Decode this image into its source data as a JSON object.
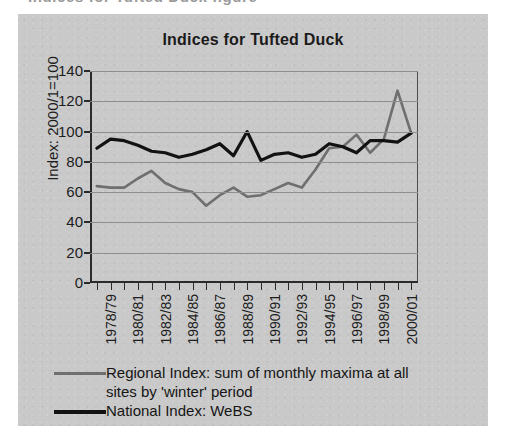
{
  "scan": {
    "cropped_header_text": "Indices for Tufted Duck figure",
    "panel_background": "#c9c9c9"
  },
  "chart_data": {
    "type": "line",
    "title": "Indices for Tufted Duck",
    "xlabel": "",
    "ylabel": "Index: 2000/1=100",
    "ylim": [
      0,
      140
    ],
    "yticks": [
      0,
      20,
      40,
      60,
      80,
      100,
      120,
      140
    ],
    "grid": true,
    "legend_position": "below",
    "categories": [
      "1978/79",
      "1979/80",
      "1980/81",
      "1981/82",
      "1982/83",
      "1983/84",
      "1984/85",
      "1985/86",
      "1986/87",
      "1987/88",
      "1988/89",
      "1989/90",
      "1990/91",
      "1991/92",
      "1992/93",
      "1993/94",
      "1994/95",
      "1995/96",
      "1996/97",
      "1997/98",
      "1998/99",
      "1999/00",
      "2000/01",
      "2001/02"
    ],
    "tick_labels": [
      "1978/79",
      "",
      "1980/81",
      "",
      "1982/83",
      "",
      "1984/85",
      "",
      "1986/87",
      "",
      "1988/89",
      "",
      "1990/91",
      "",
      "1992/93",
      "",
      "1994/95",
      "",
      "1996/97",
      "",
      "1998/99",
      "",
      "2000/01",
      ""
    ],
    "series": [
      {
        "name": "Regional Index: sum of monthly maxima at all sites by 'winter' period",
        "short_name": "Regional Index",
        "color": "#6f6f6f",
        "values": [
          64,
          63,
          63,
          69,
          74,
          66,
          62,
          60,
          51,
          58,
          63,
          57,
          58,
          62,
          66,
          63,
          75,
          89,
          90,
          98,
          86,
          95,
          127,
          99
        ]
      },
      {
        "name": "National Index: WeBS",
        "short_name": "National Index",
        "color": "#121212",
        "values": [
          89,
          95,
          94,
          91,
          87,
          86,
          83,
          85,
          88,
          92,
          84,
          100,
          81,
          85,
          86,
          83,
          85,
          92,
          90,
          86,
          94,
          94,
          93,
          99
        ]
      }
    ]
  },
  "legend": {
    "regional_line1": "Regional Index: sum of monthly maxima at all",
    "regional_line2": "sites by 'winter' period",
    "national": "National Index: WeBS"
  }
}
